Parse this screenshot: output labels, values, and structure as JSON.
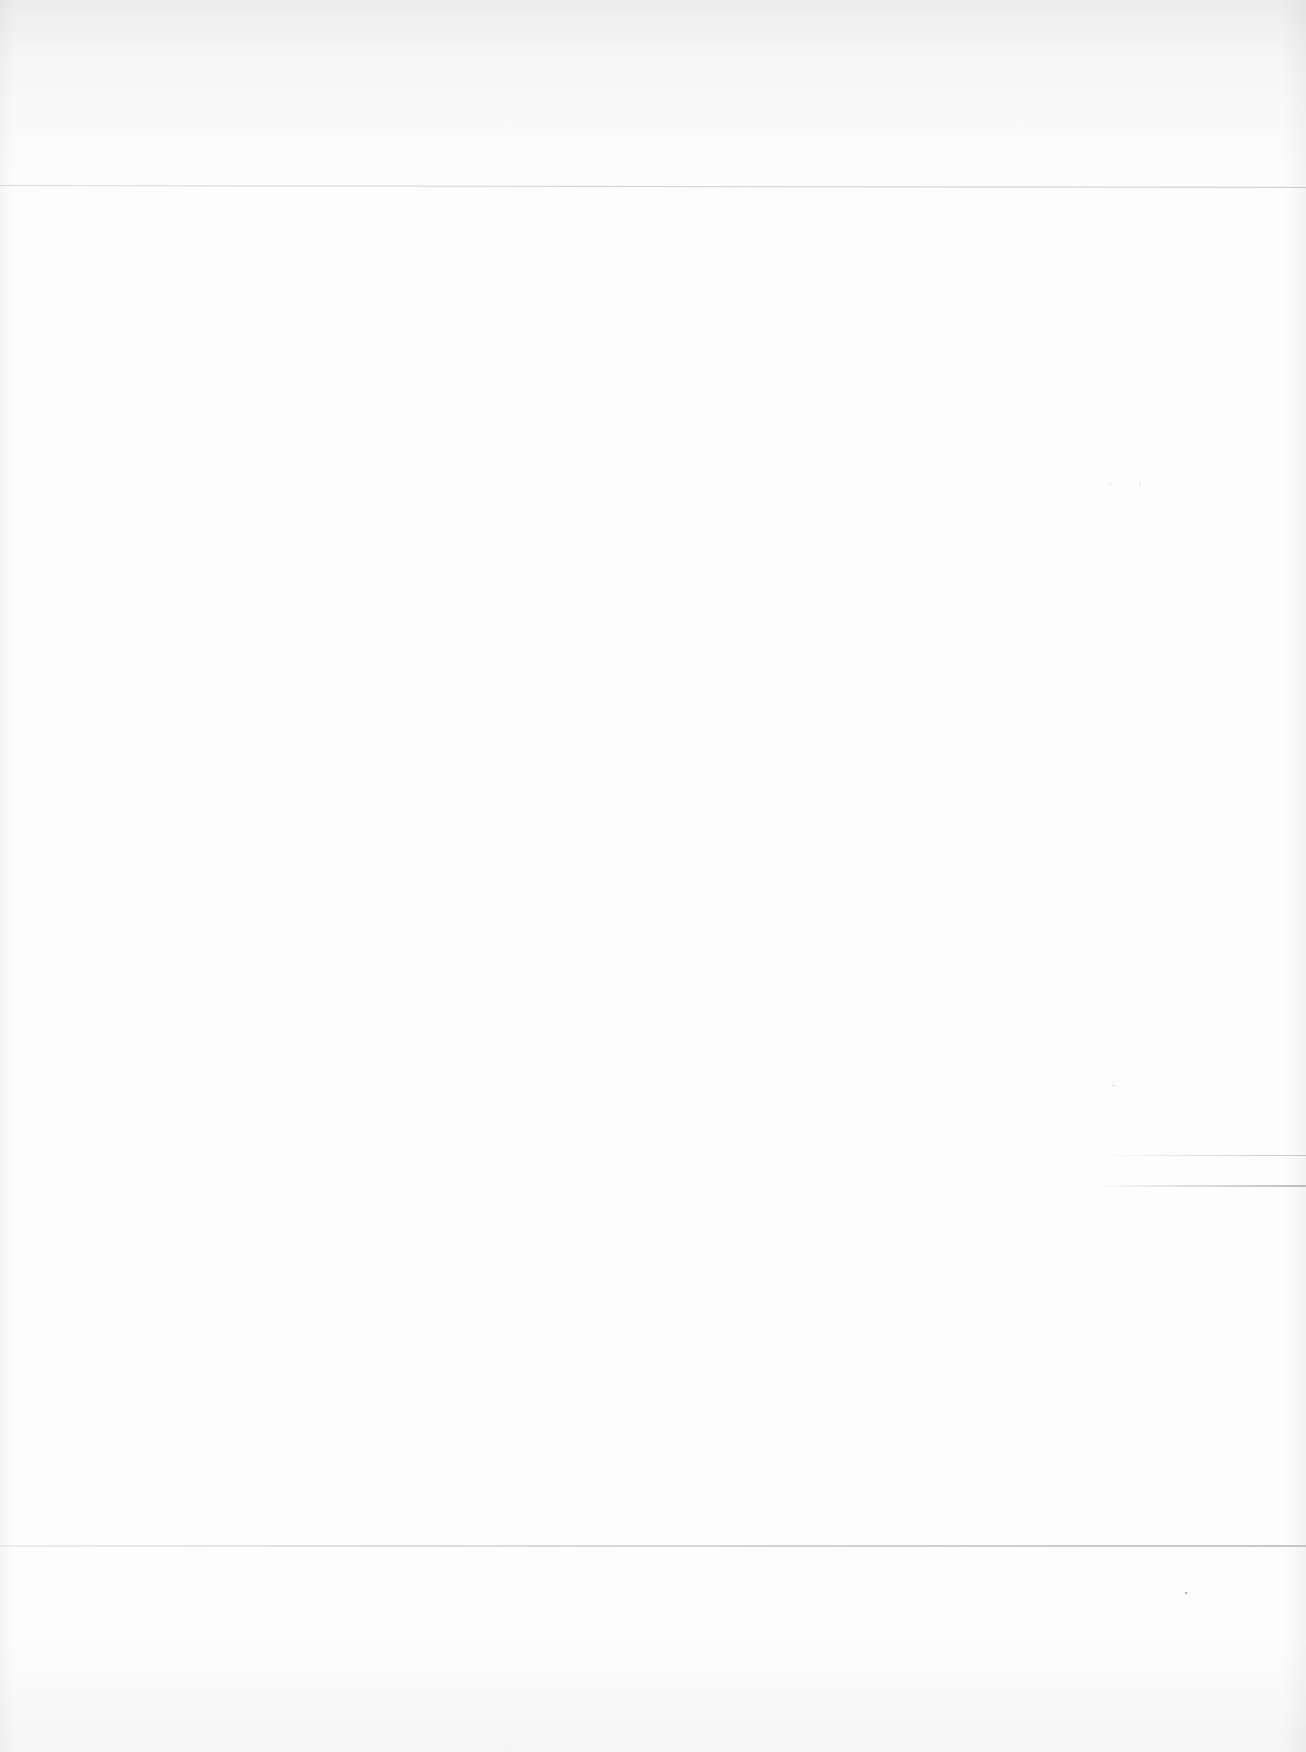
{
  "document": {
    "type": "blank scanned page",
    "text_content": ""
  }
}
